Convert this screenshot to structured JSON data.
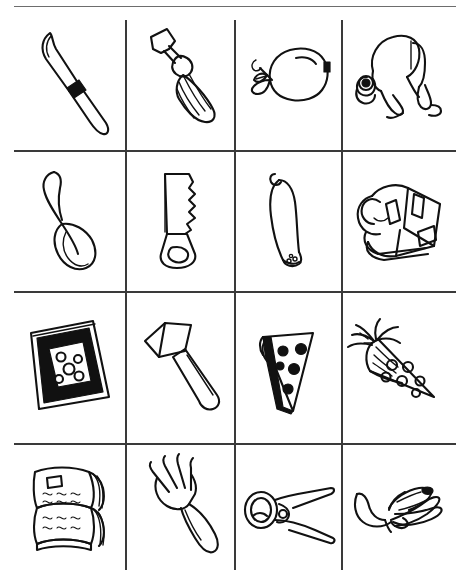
{
  "page": {
    "type": "4x4 picture grid",
    "background_color": "#ffffff",
    "ink_color": "#111111",
    "rule_color": "#3a3a3a",
    "width": 470,
    "height": 585
  },
  "grid": {
    "rows": 4,
    "columns": 4,
    "row_labels": [
      "row-1",
      "row-2",
      "row-3",
      "row-4"
    ],
    "column_labels": [
      "column-1",
      "column-2",
      "column-3",
      "column-4"
    ],
    "horizontal_rule_y": [
      6,
      150,
      291,
      443
    ],
    "vertical_rule_x": [
      125,
      234,
      341
    ],
    "vertical_rule_top": 20,
    "vertical_rule_bottom": 570
  },
  "cells": [
    {
      "id": "r1c1",
      "row": 1,
      "col": 1,
      "icon": "butter-knife-icon",
      "label": "knife",
      "category": "utensil"
    },
    {
      "id": "r1c2",
      "row": 1,
      "col": 2,
      "icon": "screwdriver-icon",
      "label": "screwdriver",
      "category": "tool"
    },
    {
      "id": "r1c3",
      "row": 1,
      "col": 3,
      "icon": "pear-icon",
      "label": "pear",
      "category": "food"
    },
    {
      "id": "r1c4",
      "row": 1,
      "col": 4,
      "icon": "frog-icon",
      "label": "frog",
      "category": "animal"
    },
    {
      "id": "r2c1",
      "row": 2,
      "col": 1,
      "icon": "spoon-icon",
      "label": "spoon",
      "category": "utensil"
    },
    {
      "id": "r2c2",
      "row": 2,
      "col": 2,
      "icon": "handsaw-icon",
      "label": "saw",
      "category": "tool"
    },
    {
      "id": "r2c3",
      "row": 2,
      "col": 3,
      "icon": "sausage-icon",
      "label": "sausage",
      "category": "food"
    },
    {
      "id": "r2c4",
      "row": 2,
      "col": 4,
      "icon": "backpack-icon",
      "label": "backpack",
      "category": "object"
    },
    {
      "id": "r3c1",
      "row": 3,
      "col": 1,
      "icon": "picture-frame-icon",
      "label": "framed picture",
      "category": "object"
    },
    {
      "id": "r3c2",
      "row": 3,
      "col": 2,
      "icon": "hammer-icon",
      "label": "hammer",
      "category": "tool"
    },
    {
      "id": "r3c3",
      "row": 3,
      "col": 3,
      "icon": "pizza-slice-icon",
      "label": "pizza slice",
      "category": "food"
    },
    {
      "id": "r3c4",
      "row": 3,
      "col": 4,
      "icon": "carrot-icon",
      "label": "carrot",
      "category": "food"
    },
    {
      "id": "r4c1",
      "row": 4,
      "col": 1,
      "icon": "open-book-icon",
      "label": "open book",
      "category": "object"
    },
    {
      "id": "r4c2",
      "row": 4,
      "col": 2,
      "icon": "fork-icon",
      "label": "fork",
      "category": "utensil"
    },
    {
      "id": "r4c3",
      "row": 4,
      "col": 3,
      "icon": "pliers-icon",
      "label": "pliers",
      "category": "tool"
    },
    {
      "id": "r4c4",
      "row": 4,
      "col": 4,
      "icon": "peeled-banana-icon",
      "label": "banana",
      "category": "food"
    }
  ]
}
